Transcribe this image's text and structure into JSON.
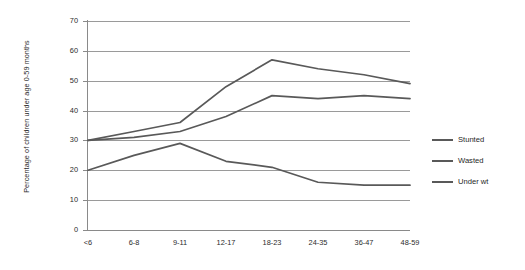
{
  "chart_data": {
    "type": "line",
    "title": "",
    "xlabel": "",
    "ylabel": "Percentage of children under age 0-59 months",
    "categories": [
      "<6",
      "6-8",
      "9-11",
      "12-17",
      "18-23",
      "24-35",
      "36-47",
      "48-59"
    ],
    "ylim": [
      0,
      70
    ],
    "yticks": [
      0,
      10,
      20,
      30,
      40,
      50,
      60,
      70
    ],
    "grid": true,
    "legend_position": "right",
    "series": [
      {
        "name": "Stunted",
        "color": "#595959",
        "values": [
          30,
          33,
          36,
          48,
          57,
          54,
          52,
          49
        ]
      },
      {
        "name": "Wasted",
        "color": "#595959",
        "values": [
          30,
          31,
          33,
          38,
          45,
          44,
          45,
          44
        ]
      },
      {
        "name": "Under wt",
        "color": "#595959",
        "values": [
          20,
          25,
          29,
          23,
          21,
          16,
          15,
          15
        ]
      }
    ]
  },
  "axis": {
    "y_title": "Percentage of children under age 0-59 months",
    "y_tick_labels": [
      "70",
      "60",
      "50",
      "40",
      "30",
      "20",
      "10",
      "0"
    ],
    "x_tick_labels": [
      "<6",
      "6-8",
      "9-11",
      "12-17",
      "18-23",
      "24-35",
      "36-47",
      "48-59"
    ]
  },
  "legend": {
    "items": [
      {
        "label": "Stunted"
      },
      {
        "label": "Wasted"
      },
      {
        "label": "Under wt"
      }
    ]
  }
}
